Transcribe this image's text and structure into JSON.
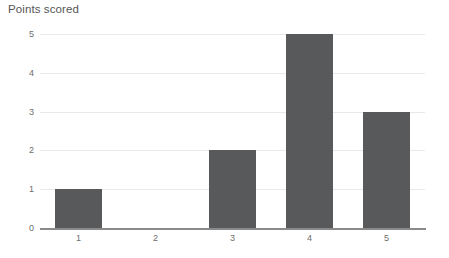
{
  "chart_data": {
    "type": "bar",
    "title": "Points scored",
    "xlabel": "",
    "ylabel": "",
    "categories": [
      "1",
      "2",
      "3",
      "4",
      "5"
    ],
    "values": [
      1,
      0,
      2,
      5,
      3
    ],
    "ylim": [
      0,
      5
    ],
    "yticks": [
      "0",
      "1",
      "2",
      "3",
      "4",
      "5"
    ],
    "grid": true,
    "legend": false,
    "bar_color": "#58595b",
    "grid_color": "#e9e9e9",
    "axis_color": "#8a8a8a",
    "text_color": "#6d6d6d",
    "title_color": "#555555"
  }
}
